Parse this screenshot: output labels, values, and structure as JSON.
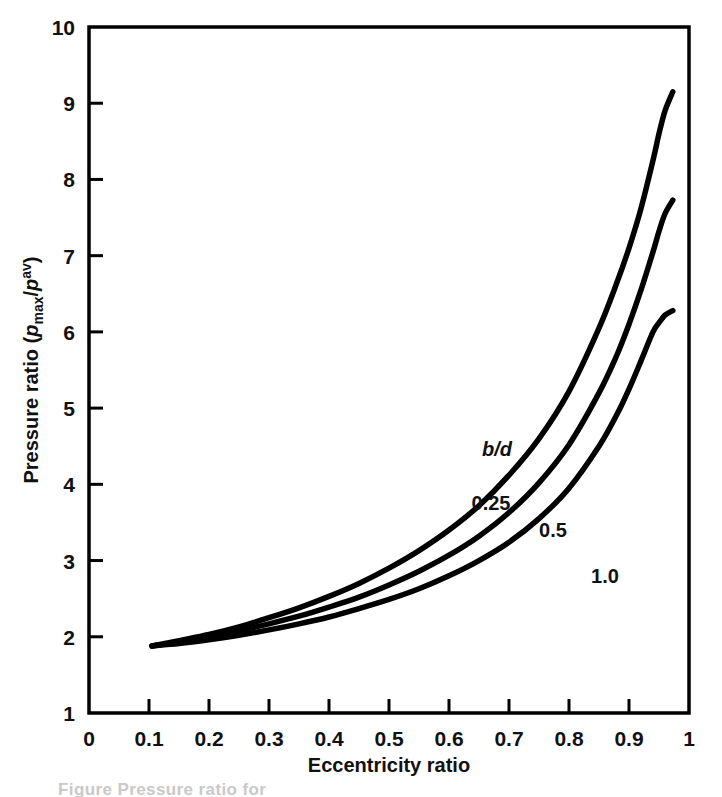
{
  "figure": {
    "background_color": "#ffffff",
    "line_color": "#000000",
    "caption_partial": "Figure  Pressure ratio for"
  },
  "axes": {
    "x": {
      "title": "Eccentricity ratio",
      "ticks": [
        "0",
        "0.1",
        "0.2",
        "0.3",
        "0.4",
        "0.5",
        "0.6",
        "0.7",
        "0.8",
        "0.9",
        "1"
      ],
      "min": 0,
      "max": 1
    },
    "y": {
      "title_prefix": "Pressure ratio (",
      "title_p1": "p",
      "title_sub": "max",
      "title_slash": "/",
      "title_p2": "p",
      "title_sup": "av",
      "title_suffix": ")",
      "ticks": [
        "1",
        "2",
        "3",
        "4",
        "5",
        "6",
        "7",
        "8",
        "9",
        "10"
      ],
      "min": 1,
      "max": 10
    }
  },
  "curve_labels": {
    "legend_title": "b/d",
    "label_025": "0.25",
    "label_05": "0.5",
    "label_10": "1.0"
  },
  "chart_data": {
    "type": "line",
    "title": "",
    "xlabel": "Eccentricity ratio",
    "ylabel": "Pressure ratio (p_max/p^av)",
    "xlim": [
      0,
      1
    ],
    "ylim": [
      1,
      10
    ],
    "xticks": [
      0,
      0.1,
      0.2,
      0.3,
      0.4,
      0.5,
      0.6,
      0.7,
      0.8,
      0.9,
      1
    ],
    "yticks": [
      1,
      2,
      3,
      4,
      5,
      6,
      7,
      8,
      9,
      10
    ],
    "grid": false,
    "legend": "inline-curve-labels",
    "legend_title": "b/d",
    "series": [
      {
        "name": "0.25",
        "label": "0.25",
        "x": [
          0.105,
          0.15,
          0.2,
          0.25,
          0.3,
          0.35,
          0.4,
          0.45,
          0.5,
          0.55,
          0.6,
          0.65,
          0.7,
          0.75,
          0.8,
          0.85,
          0.88,
          0.9,
          0.92,
          0.94,
          0.95,
          0.96,
          0.973
        ],
        "y": [
          1.88,
          1.95,
          2.03,
          2.13,
          2.25,
          2.38,
          2.53,
          2.7,
          2.9,
          3.13,
          3.4,
          3.72,
          4.12,
          4.6,
          5.22,
          6.05,
          6.65,
          7.1,
          7.62,
          8.25,
          8.6,
          8.9,
          9.15
        ]
      },
      {
        "name": "0.5",
        "label": "0.5",
        "x": [
          0.105,
          0.15,
          0.2,
          0.25,
          0.3,
          0.35,
          0.4,
          0.45,
          0.5,
          0.55,
          0.6,
          0.65,
          0.7,
          0.75,
          0.8,
          0.85,
          0.88,
          0.9,
          0.92,
          0.94,
          0.95,
          0.96,
          0.973
        ],
        "y": [
          1.88,
          1.93,
          2.0,
          2.08,
          2.17,
          2.27,
          2.39,
          2.52,
          2.68,
          2.86,
          3.07,
          3.32,
          3.63,
          4.02,
          4.52,
          5.2,
          5.7,
          6.1,
          6.55,
          7.05,
          7.32,
          7.55,
          7.73
        ]
      },
      {
        "name": "1.0",
        "label": "1.0",
        "x": [
          0.105,
          0.15,
          0.2,
          0.25,
          0.3,
          0.35,
          0.4,
          0.45,
          0.5,
          0.55,
          0.6,
          0.65,
          0.7,
          0.75,
          0.8,
          0.85,
          0.88,
          0.9,
          0.92,
          0.94,
          0.95,
          0.96,
          0.973
        ],
        "y": [
          1.88,
          1.91,
          1.96,
          2.02,
          2.09,
          2.17,
          2.26,
          2.37,
          2.49,
          2.63,
          2.8,
          3.0,
          3.24,
          3.55,
          3.95,
          4.5,
          4.92,
          5.25,
          5.62,
          6.0,
          6.12,
          6.22,
          6.28
        ]
      }
    ]
  }
}
